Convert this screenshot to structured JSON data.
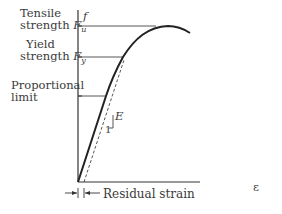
{
  "diagram": {
    "type": "stress-strain curve",
    "y_axis_label": "f",
    "x_axis_label": "ε",
    "levels": [
      {
        "name": "tensile-strength",
        "line1": "Tensile",
        "line2": "strength",
        "symbol": "F",
        "subscript": "u"
      },
      {
        "name": "yield-strength",
        "line1": "Yield",
        "line2": "strength",
        "symbol": "F",
        "subscript": "y"
      },
      {
        "name": "proportional-limit",
        "line1": "Proportional",
        "line2": "limit"
      }
    ],
    "slope_label": "E",
    "slope_run": "1",
    "residual_label": "Residual strain"
  }
}
